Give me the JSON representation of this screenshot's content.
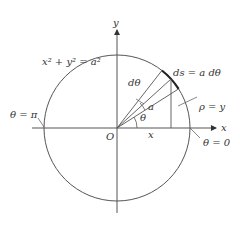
{
  "diagram": {
    "colors": {
      "line": "#555555",
      "text": "#333333",
      "arc_highlight": "#222222",
      "background": "#ffffff"
    },
    "labels": {
      "y_axis": "y",
      "x_axis": "x",
      "origin": "O",
      "equation": "x² + y² = a²",
      "arc_length": "ds = a dθ",
      "d_theta": "dθ",
      "radius": "a",
      "theta": "θ",
      "x_segment": "x",
      "rho": "ρ = y",
      "theta_pi": "θ = π",
      "theta_zero": "θ = 0"
    }
  }
}
